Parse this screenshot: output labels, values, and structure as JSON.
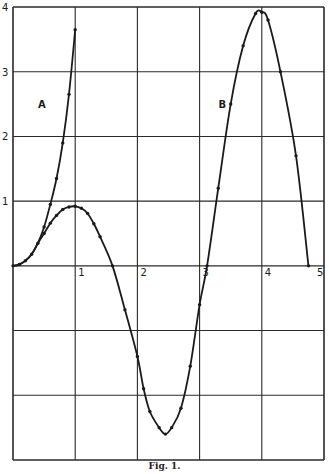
{
  "caption": "Fig. 1.",
  "colors": {
    "ink": "#1a1a1a",
    "grid": "#2a2a2a",
    "background": "#ffffff"
  },
  "chart_data": {
    "type": "line",
    "title": "",
    "caption": "Fig. 1.",
    "xlabel": "",
    "ylabel": "",
    "xlim": [
      0,
      5
    ],
    "ylim": [
      -3,
      4
    ],
    "grid": true,
    "x_ticks": [
      "1",
      "2",
      "3",
      "4",
      "5"
    ],
    "y_ticks": [
      "1",
      "2",
      "3",
      "4"
    ],
    "annotations": [
      {
        "text": "A",
        "x": 0.5,
        "y": 2.5
      },
      {
        "text": "B",
        "x": 3.4,
        "y": 2.5
      }
    ],
    "series": [
      {
        "name": "A",
        "points": [
          [
            0,
            0
          ],
          [
            0.1,
            0.02
          ],
          [
            0.2,
            0.08
          ],
          [
            0.3,
            0.18
          ],
          [
            0.4,
            0.35
          ],
          [
            0.5,
            0.6
          ],
          [
            0.6,
            0.95
          ],
          [
            0.7,
            1.35
          ],
          [
            0.8,
            1.9
          ],
          [
            0.9,
            2.65
          ],
          [
            1.0,
            3.65
          ]
        ]
      },
      {
        "name": "B",
        "points": [
          [
            0,
            0
          ],
          [
            0.1,
            0.02
          ],
          [
            0.2,
            0.08
          ],
          [
            0.3,
            0.18
          ],
          [
            0.4,
            0.35
          ],
          [
            0.5,
            0.5
          ],
          [
            0.6,
            0.66
          ],
          [
            0.7,
            0.78
          ],
          [
            0.8,
            0.87
          ],
          [
            0.9,
            0.91
          ],
          [
            1.0,
            0.92
          ],
          [
            1.1,
            0.89
          ],
          [
            1.2,
            0.81
          ],
          [
            1.3,
            0.65
          ],
          [
            1.4,
            0.45
          ],
          [
            1.6,
            0.0
          ],
          [
            1.8,
            -0.68
          ],
          [
            2.0,
            -1.4
          ],
          [
            2.1,
            -1.9
          ],
          [
            2.2,
            -2.25
          ],
          [
            2.35,
            -2.5
          ],
          [
            2.45,
            -2.6
          ],
          [
            2.55,
            -2.5
          ],
          [
            2.7,
            -2.2
          ],
          [
            2.85,
            -1.55
          ],
          [
            3.0,
            -0.6
          ],
          [
            3.12,
            0.0
          ],
          [
            3.3,
            1.2
          ],
          [
            3.5,
            2.5
          ],
          [
            3.7,
            3.4
          ],
          [
            3.9,
            3.9
          ],
          [
            4.0,
            3.92
          ],
          [
            4.1,
            3.8
          ],
          [
            4.3,
            3.0
          ],
          [
            4.55,
            1.7
          ],
          [
            4.75,
            0.0
          ]
        ]
      }
    ]
  }
}
